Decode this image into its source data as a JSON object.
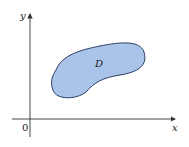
{
  "diagram": {
    "x_axis_label": "x",
    "y_axis_label": "y",
    "origin_label": "0",
    "region_label": "D",
    "colors": {
      "region_fill": "#a9c4e8",
      "region_stroke": "#2c3e66",
      "axis": "#333333"
    }
  }
}
